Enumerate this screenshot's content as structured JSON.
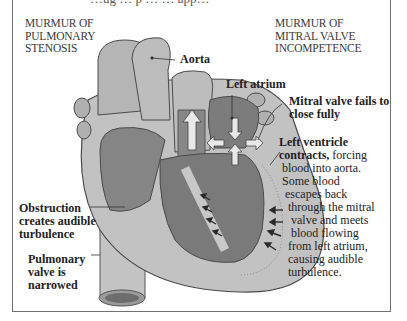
{
  "top_clipped_text": "…ug … p … … app…",
  "captions": {
    "left": "MURMUR OF\nPULMONARY\nSTENOSIS",
    "right": "MURMUR OF\nMITRAL VALVE\nINCOMPETENCE"
  },
  "labels": {
    "aorta": "Aorta",
    "left_atrium": "Left atrium",
    "mitral_valve": "Mitral valve fails to\nclose fully",
    "left_ventricle_bold": "Left ventricle\ncontracts,",
    "left_ventricle_text": " forcing",
    "left_ventricle_rest": " blood into aorta.\n Some blood\n  escapes back\n   through the mitral\n    valve and meets\n    blood flowing\n   from left atrium,\n   causing audible\n   turbulence.",
    "obstruction": "Obstruction\ncreates audible\nturbulence",
    "pulmonary_valve": "Pulmonary\nvalve is\nnarrowed"
  },
  "colors": {
    "outer_tissue": "#b8b8b8",
    "inner_chamber": "#7a7a7a",
    "wall": "#d0d0d0",
    "dark_outline": "#4a4a4a",
    "frame": "#707070"
  }
}
